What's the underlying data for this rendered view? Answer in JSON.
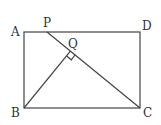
{
  "diagram": {
    "type": "geometry",
    "shape": "rectangle ABCD with segment PC and perpendicular BQ",
    "points": {
      "A": {
        "label": "A",
        "x": 24,
        "y": 32
      },
      "B": {
        "label": "B",
        "x": 24,
        "y": 108
      },
      "C": {
        "label": "C",
        "x": 140,
        "y": 108
      },
      "D": {
        "label": "D",
        "x": 140,
        "y": 32
      },
      "P": {
        "label": "P",
        "x": 47,
        "y": 32
      },
      "Q": {
        "label": "Q",
        "x": 70.4,
        "y": 51.2
      }
    },
    "segments": [
      "AB",
      "BC",
      "CD",
      "DA",
      "PC",
      "BQ"
    ],
    "annotations": [
      "right angle at Q (BQ ⊥ PC)"
    ]
  }
}
